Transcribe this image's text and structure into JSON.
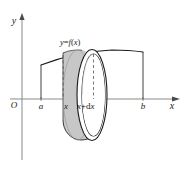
{
  "figure": {
    "type": "math-diagram",
    "background_color": "#ffffff",
    "stroke_color": "#1a1a1a",
    "shell_fill_color": "#c9c9c9",
    "shell_face_fill_color": "#ffffff",
    "shell_inner_fill_color": "#d6d6d6"
  },
  "axes": {
    "y_axis_label": "y",
    "x_axis_label": "x",
    "origin_label": "O"
  },
  "curve": {
    "label": "y=f(x)",
    "label_parts": {
      "y": "y",
      "equals": "=",
      "f": "f",
      "open_paren": "(",
      "x": "x",
      "close_paren": ")"
    }
  },
  "ticks": [
    {
      "name": "a",
      "label": "a"
    },
    {
      "name": "x",
      "label": "x"
    },
    {
      "name": "x-plus-dx",
      "label": "x+dx"
    },
    {
      "name": "b",
      "label": "b"
    }
  ],
  "tick_labels": {
    "a": "a",
    "x": "x",
    "x_plus_dx": "x+dx",
    "x_plus_dx_parts": {
      "x": "x",
      "plus": "+",
      "d": "d",
      "dx_x": "x"
    },
    "b": "b"
  }
}
